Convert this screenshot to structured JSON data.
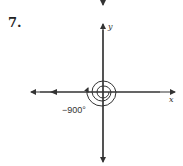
{
  "problem": {
    "number": "7."
  },
  "axes": {
    "x_label": "x",
    "y_label": "y"
  },
  "angle": {
    "label": "−900°",
    "degrees": -900,
    "rotations": 2.5,
    "direction": "clockwise"
  },
  "colors": {
    "stroke": "#333333",
    "background": "#ffffff"
  }
}
